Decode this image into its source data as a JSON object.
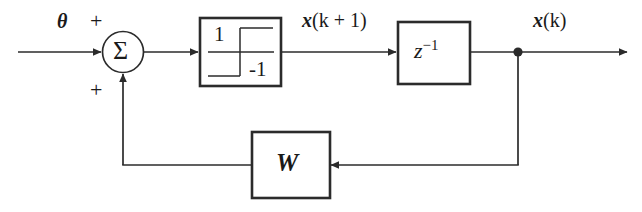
{
  "figure": {
    "type": "block-diagram",
    "background_color": "#ffffff",
    "line_color": "#2b2b2b"
  },
  "labels": {
    "input_signal": "θ",
    "sum_plus_top": "+",
    "sum_plus_bottom": "+",
    "sum_symbol": "Σ",
    "limiter_upper_level": "1",
    "limiter_lower_level": "-1",
    "state_next": "x",
    "state_next_arg": "(k + 1)",
    "delay_base": "z",
    "delay_exponent": "−1",
    "state_current": "x",
    "state_current_arg": "(k)",
    "weight_matrix": "W"
  },
  "blocks": [
    {
      "id": "summing-junction",
      "name": "summing-junction",
      "shape": "circle",
      "label": "Σ",
      "inputs": [
        "θ (+)",
        "feedback (+)"
      ],
      "outputs": [
        "to-saturation-block"
      ]
    },
    {
      "id": "saturation-block",
      "name": "saturation-nonlinearity-block",
      "shape": "rectangle",
      "label_upper": "1",
      "label_lower": "-1",
      "function": "hard-limiter / saturation",
      "inputs": [
        "from-summing-junction"
      ],
      "outputs": [
        "x(k + 1)"
      ]
    },
    {
      "id": "delay-block",
      "name": "unit-delay-block",
      "shape": "rectangle",
      "label": "z^-1",
      "function": "unit delay",
      "inputs": [
        "x(k + 1)"
      ],
      "outputs": [
        "x(k)"
      ]
    },
    {
      "id": "weight-block",
      "name": "weight-matrix-block",
      "shape": "rectangle",
      "label": "W",
      "function": "feedback weight matrix",
      "inputs": [
        "x(k) tap"
      ],
      "outputs": [
        "to-summing-junction"
      ]
    }
  ],
  "connections": [
    {
      "from": "input-theta",
      "to": "summing-junction",
      "sign": "+"
    },
    {
      "from": "summing-junction",
      "to": "saturation-block",
      "sign": ""
    },
    {
      "from": "saturation-block",
      "to": "delay-block",
      "signal": "x(k + 1)"
    },
    {
      "from": "delay-block",
      "to": "output-terminal",
      "signal": "x(k)"
    },
    {
      "from": "output-tap",
      "to": "weight-block",
      "signal": "x(k)"
    },
    {
      "from": "weight-block",
      "to": "summing-junction",
      "sign": "+"
    }
  ]
}
